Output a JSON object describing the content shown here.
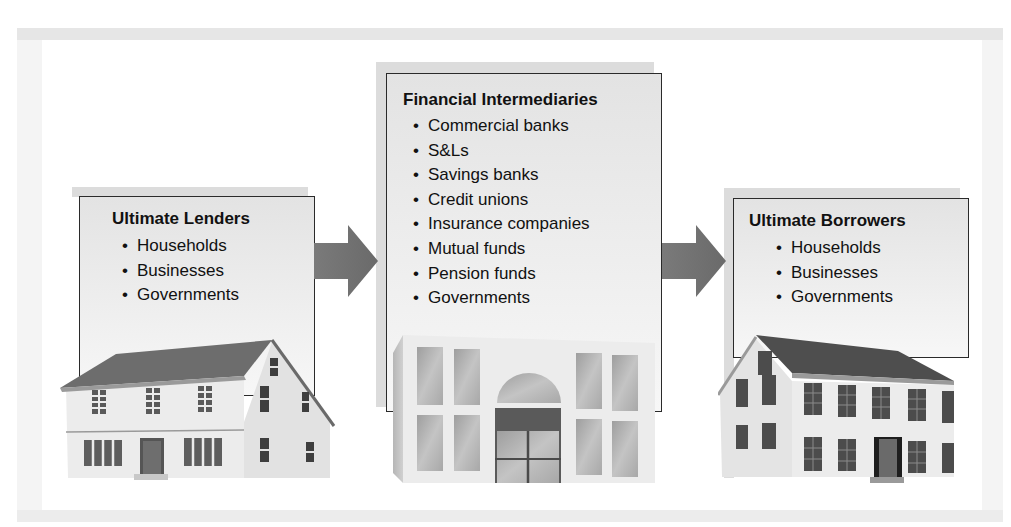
{
  "diagram": {
    "type": "flow",
    "flow_direction": "left-to-right",
    "nodes": [
      {
        "id": "lenders",
        "title": "Ultimate Lenders",
        "items": [
          "Households",
          "Businesses",
          "Governments"
        ],
        "illustration": "house-icon"
      },
      {
        "id": "intermediaries",
        "title": "Financial Intermediaries",
        "items": [
          "Commercial banks",
          "S&Ls",
          "Savings banks",
          "Credit unions",
          "Insurance companies",
          "Mutual funds",
          "Pension funds",
          "Governments"
        ],
        "illustration": "bank-building-icon"
      },
      {
        "id": "borrowers",
        "title": "Ultimate Borrowers",
        "items": [
          "Households",
          "Businesses",
          "Governments"
        ],
        "illustration": "colonial-house-icon"
      }
    ],
    "edges": [
      {
        "from": "lenders",
        "to": "intermediaries",
        "icon": "arrow-right-icon"
      },
      {
        "from": "intermediaries",
        "to": "borrowers",
        "icon": "arrow-right-icon"
      }
    ],
    "colors": {
      "arrow": "#6e6e6e",
      "box_border": "#2a2a2a",
      "box_fill": "#e9e9e9",
      "roof": "#6a6a6a"
    }
  }
}
